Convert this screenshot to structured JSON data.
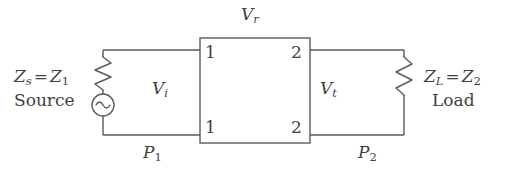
{
  "figure": {
    "type": "two-port-network-circuit-diagram",
    "background_color": "#ffffff",
    "line_color": "#5a5a5a",
    "text_color": "#3f3f3f"
  },
  "labels": {
    "source_impedance": {
      "symbol": "Z",
      "symbol_sub": "s",
      "equals": "=",
      "value": "Z",
      "value_sub": "1",
      "full_text": "Z_s = Z_1"
    },
    "source_name": "Source",
    "load_impedance": {
      "symbol": "Z",
      "symbol_sub": "L",
      "equals": "=",
      "value": "Z",
      "value_sub": "2",
      "full_text": "Z_L = Z_2"
    },
    "load_name": "Load",
    "voltage_reflected": {
      "symbol": "V",
      "sub": "r"
    },
    "voltage_incident": {
      "symbol": "V",
      "sub": "i"
    },
    "voltage_transmitted": {
      "symbol": "V",
      "sub": "t"
    },
    "power_input": {
      "symbol": "P",
      "sub": "1"
    },
    "power_output": {
      "symbol": "P",
      "sub": "2"
    }
  },
  "ports": {
    "left_top": "1",
    "left_bottom": "1",
    "right_top": "2",
    "right_bottom": "2"
  },
  "components": {
    "source_resistor": "zigzag-resistor",
    "load_resistor": "zigzag-resistor",
    "ac_source": "ac-source-sine-circle",
    "network_box": "two-port-network-box"
  }
}
